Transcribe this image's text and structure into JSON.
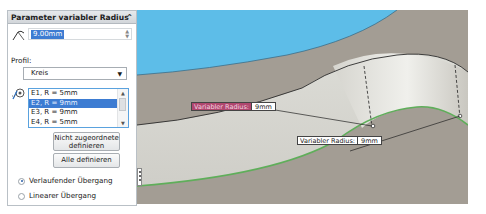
{
  "panel": {
    "title": "Parameter variabler Radius",
    "collapse_icon": "double-chevron-up-icon",
    "radius_value": "9.00mm",
    "profile_label": "Profil:",
    "profile_selected": "Kreis",
    "edges": [
      {
        "label": "E1, R = 5mm",
        "selected": false
      },
      {
        "label": "E2, R = 9mm",
        "selected": true
      },
      {
        "label": "E3, R = 9mm",
        "selected": false
      },
      {
        "label": "E4, R = 5mm",
        "selected": false
      }
    ],
    "btn_unassigned": "Nicht zugeordnete definieren",
    "btn_unassigned_line1": "Nicht zugeordnete",
    "btn_unassigned_line2": "definieren",
    "btn_all": "Alle definieren",
    "radio_smooth": "Verlaufender Übergang",
    "radio_linear": "Linearer Übergang",
    "radio_selected": "Verlaufender Übergang"
  },
  "viewport": {
    "callouts": [
      {
        "label": "Variabler Radius:",
        "value": "9mm",
        "active": true
      },
      {
        "label": "Variabler Radius:",
        "value": "9mm",
        "active": false
      }
    ],
    "colors": {
      "sky_blue": "#5dbde8",
      "gray_surface": "#a39d94",
      "fillet_light": "#e8e8e2",
      "edge_green": "#5fae5a",
      "callout_active": "#b0476e"
    }
  }
}
